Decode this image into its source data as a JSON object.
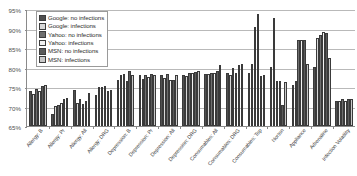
{
  "chart_data": {
    "type": "bar",
    "title": "",
    "subtitle": "",
    "xlabel": "",
    "ylabel": "",
    "ylim": [
      65,
      95
    ],
    "ytick_values": [
      65,
      70,
      75,
      80,
      85,
      90,
      95
    ],
    "ytick_labels": [
      "65%",
      "70%",
      "75%",
      "80%",
      "85%",
      "90%",
      "95%"
    ],
    "grid": true,
    "legend_position": "top-left",
    "categories": [
      "Allergy: B",
      "Allergy: Pr",
      "Allergy: All",
      "Allergy: DRG",
      "Depression: B",
      "Depression: Pr",
      "Depression: All",
      "Depression: DRG",
      "Consumables: All",
      "Consumables: DRG",
      "Consumables: Top",
      "Norton",
      "Appliance",
      "Adrenaline",
      "Infection Volatility"
    ],
    "series": [
      {
        "name": "Google: no infections",
        "color": "#4f4f4f",
        "values": [
          74.0,
          68.2,
          74.2,
          73.0,
          76.8,
          78.0,
          78.0,
          78.2,
          78.4,
          78.6,
          78.7,
          80.2,
          75.4,
          80.2,
          71.5
        ]
      },
      {
        "name": "Google: infections",
        "color": "#d8d8d8",
        "values": [
          73.3,
          70.2,
          71.0,
          75.0,
          78.0,
          77.0,
          77.3,
          77.7,
          78.3,
          78.0,
          81.0,
          92.8,
          76.5,
          87.5,
          71.3
        ]
      },
      {
        "name": "Yahoo: no infections",
        "color": "#6e6e6e",
        "values": [
          74.5,
          70.4,
          71.8,
          75.0,
          78.3,
          78.0,
          78.3,
          78.5,
          78.6,
          79.8,
          90.3,
          76.6,
          87.0,
          88.4,
          71.8
        ]
      },
      {
        "name": "Yahoo: infections",
        "color": "#f2f2f2",
        "values": [
          74.0,
          70.8,
          70.6,
          75.2,
          76.5,
          77.5,
          76.8,
          78.6,
          78.5,
          78.6,
          93.7,
          76.5,
          87.0,
          89.2,
          71.5
        ]
      },
      {
        "name": "MSN: no infections",
        "color": "#5a5a5a",
        "values": [
          75.2,
          72.0,
          71.4,
          74.0,
          79.2,
          78.3,
          76.8,
          78.8,
          79.0,
          80.6,
          77.8,
          70.3,
          87.0,
          88.8,
          72.0
        ]
      },
      {
        "name": "MSN: infections",
        "color": "#c8c8c8",
        "values": [
          75.4,
          72.3,
          73.5,
          74.2,
          78.0,
          78.2,
          78.2,
          79.0,
          80.7,
          80.8,
          78.0,
          76.2,
          80.8,
          82.5,
          71.9
        ]
      }
    ]
  },
  "legend": {
    "items": [
      {
        "label": "Google: no infections"
      },
      {
        "label": "Google: infections"
      },
      {
        "label": "Yahoo: no infections"
      },
      {
        "label": "Yahoo: infections"
      },
      {
        "label": "MSN: no infections"
      },
      {
        "label": "MSN: infections"
      }
    ]
  }
}
